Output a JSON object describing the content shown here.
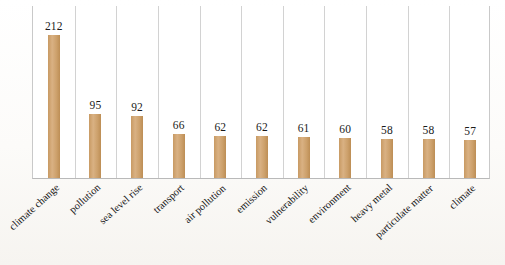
{
  "figure": {
    "background_color": "#fdfdfc",
    "plot_background_color": "#ffffff",
    "bar_color": "#c89a63",
    "gridline_color": "#d2d2d2",
    "axis_color": "#b9b9b9",
    "label_color": "#161616"
  },
  "chart_data": {
    "type": "bar",
    "title": "",
    "subtitle": "",
    "xlabel": "",
    "ylabel": "",
    "ylim": [
      0,
      230
    ],
    "grid": "vertical-category-separators",
    "legend": "none",
    "orientation": "vertical",
    "categories": [
      "climate change",
      "pollution",
      "sea level rise",
      "transport",
      "air pollution",
      "emission",
      "vulnerability",
      "environment",
      "heavy metal",
      "particulate matter",
      "climate"
    ],
    "values": [
      212,
      95,
      92,
      66,
      62,
      62,
      61,
      60,
      58,
      58,
      57
    ],
    "value_labels": [
      "212",
      "95",
      "92",
      "66",
      "62",
      "62",
      "61",
      "60",
      "58",
      "58",
      "57"
    ],
    "tick_label_rotation_deg": -42,
    "data_labels_shown": true,
    "data_label_position": "above-bar"
  },
  "caption": {
    "text": ""
  }
}
